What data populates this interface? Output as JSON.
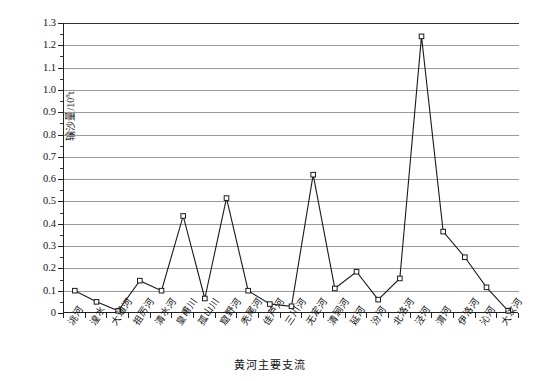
{
  "chart_data": {
    "type": "line",
    "title": "",
    "xlabel": "黄河主要支流",
    "ylabel": "输沙量/10⁸t",
    "ylabel_text": "输沙量/10",
    "ylabel_sup": "8",
    "ylabel_unit_tail": "t",
    "ylim": [
      0,
      1.3
    ],
    "ytick_step": 0.1,
    "grid": true,
    "legend": "none",
    "marker": "open-square",
    "line_color": "#1a1a1a",
    "grid_color": "#9a9a9a",
    "categories": [
      "洮河",
      "湟水",
      "大通河",
      "祖厉河",
      "清水河",
      "皇甫川",
      "孤山川",
      "窟野河",
      "秃尾河",
      "佳芦河",
      "三川河",
      "无定河",
      "清涧河",
      "延河",
      "汾河",
      "北洛河",
      "泾河",
      "渭河",
      "伊洛河",
      "沁河",
      "大汶河"
    ],
    "values": [
      0.1,
      0.05,
      0.01,
      0.145,
      0.1,
      0.435,
      0.065,
      0.515,
      0.1,
      0.04,
      0.03,
      0.62,
      0.11,
      0.185,
      0.06,
      0.155,
      1.24,
      0.365,
      0.25,
      0.115,
      0.01
    ],
    "ytick_labels": [
      "1.3",
      "1.2",
      "1.1",
      "1.0",
      "0.9",
      "0.8",
      "0.7",
      "0.6",
      "0.5",
      "0.4",
      "0.3",
      "0.2",
      "0.1",
      "0"
    ],
    "ytick_values": [
      1.3,
      1.2,
      1.1,
      1.0,
      0.9,
      0.8,
      0.7,
      0.6,
      0.5,
      0.4,
      0.3,
      0.2,
      0.1,
      0
    ]
  }
}
